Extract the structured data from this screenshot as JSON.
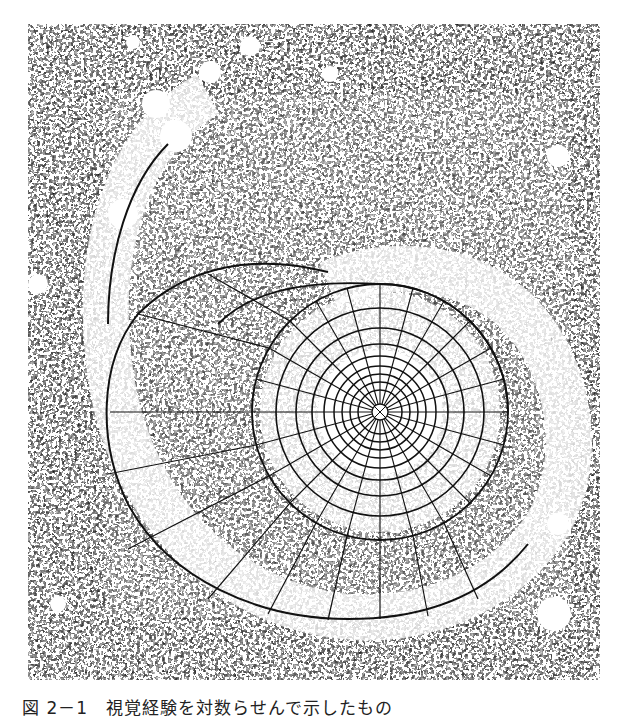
{
  "figure": {
    "center": {
      "x": 352,
      "y": 388
    },
    "colors": {
      "ink": "#111111",
      "paper": "#ffffff"
    }
  },
  "caption": {
    "text": "図 2－1　視覚経験を対数らせんで示したもの"
  }
}
